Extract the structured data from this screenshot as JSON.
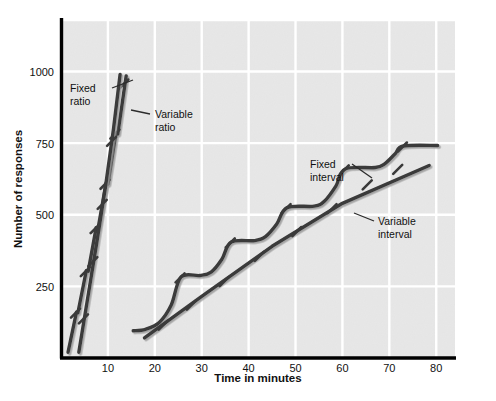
{
  "chart_data": {
    "type": "line",
    "title": "",
    "subtitle": "",
    "xlabel": "Time in minutes",
    "ylabel": "Number of responses",
    "xlim": [
      0,
      84
    ],
    "ylim": [
      0,
      1180
    ],
    "xticks": [
      10,
      20,
      30,
      40,
      50,
      60,
      70,
      80
    ],
    "xtick_labels": [
      "10",
      "20",
      "30",
      "40",
      "50",
      "60",
      "70",
      "80"
    ],
    "yticks": [
      250,
      500,
      750,
      1000
    ],
    "ytick_labels": [
      "250",
      "500",
      "750",
      "1000"
    ],
    "grid": true,
    "grid_color": "#ffffff",
    "plot_background": "#e7e7e7",
    "axis_color": "#000000",
    "line_color": "#3a3a3a",
    "legend_position": "inline-annotations",
    "series": [
      {
        "name": "Fixed ratio",
        "label": "Fixed ratio",
        "label_lines": [
          "Fixed",
          "ratio"
        ],
        "style": "stepped-steep",
        "description": "Steep stepped curve with short post-reinforcement pauses",
        "points": [
          [
            1.5,
            20
          ],
          [
            3.3,
            160
          ],
          [
            3.3,
            160
          ],
          [
            3.6,
            158
          ],
          [
            3.6,
            158
          ],
          [
            5.4,
            305
          ],
          [
            5.4,
            305
          ],
          [
            5.8,
            303
          ],
          [
            5.8,
            303
          ],
          [
            7.5,
            455
          ],
          [
            7.5,
            455
          ],
          [
            7.9,
            452
          ],
          [
            7.9,
            452
          ],
          [
            9.6,
            610
          ],
          [
            9.6,
            610
          ],
          [
            10.0,
            607
          ],
          [
            10.0,
            607
          ],
          [
            11.7,
            785
          ],
          [
            11.7,
            785
          ],
          [
            12.1,
            782
          ],
          [
            12.1,
            782
          ],
          [
            13.9,
            985
          ]
        ],
        "hash_marks": [
          [
            3.3,
            160
          ],
          [
            5.4,
            305
          ],
          [
            7.5,
            455
          ],
          [
            9.6,
            610
          ],
          [
            11.7,
            785
          ],
          [
            13.6,
            960
          ]
        ]
      },
      {
        "name": "Variable ratio",
        "label": "Variable ratio",
        "label_lines": [
          "Variable",
          "ratio"
        ],
        "style": "steady-steep",
        "description": "Steady very steep line, no pauses",
        "points": [
          [
            3.8,
            20
          ],
          [
            5.6,
            200
          ],
          [
            7.6,
            400
          ],
          [
            9.5,
            600
          ],
          [
            11.2,
            800
          ],
          [
            12.6,
            990
          ]
        ],
        "hash_marks": [
          [
            5.0,
            140
          ],
          [
            7.0,
            340
          ],
          [
            9.0,
            540
          ],
          [
            11.0,
            760
          ]
        ]
      },
      {
        "name": "Fixed interval",
        "label": "Fixed interval",
        "label_lines": [
          "Fixed",
          "interval"
        ],
        "style": "scalloped",
        "description": "Scalloped curve: accelerating runs followed by flat plateaus",
        "points": [
          [
            15.4,
            95
          ],
          [
            18.0,
            100
          ],
          [
            21.0,
            125
          ],
          [
            23.5,
            185
          ],
          [
            25.6,
            283
          ],
          [
            29.6,
            288
          ],
          [
            32.0,
            300
          ],
          [
            34.3,
            345
          ],
          [
            36.3,
            405
          ],
          [
            41.3,
            410
          ],
          [
            43.6,
            424
          ],
          [
            46.0,
            468
          ],
          [
            48.2,
            525
          ],
          [
            54.0,
            530
          ],
          [
            56.2,
            548
          ],
          [
            58.6,
            600
          ],
          [
            60.6,
            660
          ],
          [
            67.0,
            665
          ],
          [
            69.0,
            678
          ],
          [
            71.2,
            712
          ],
          [
            73.0,
            740
          ],
          [
            80.3,
            742
          ]
        ],
        "hash_marks": [
          [
            25.6,
            283
          ],
          [
            36.3,
            405
          ],
          [
            48.2,
            525
          ],
          [
            60.6,
            660
          ],
          [
            73.0,
            740
          ]
        ]
      },
      {
        "name": "Variable interval",
        "label": "Variable interval",
        "label_lines": [
          "Variable",
          "interval"
        ],
        "style": "steady-moderate",
        "description": "Steady moderate straight line, no scallops",
        "points": [
          [
            17.8,
            70
          ],
          [
            30.0,
            215
          ],
          [
            45.0,
            390
          ],
          [
            60.0,
            540
          ],
          [
            78.5,
            672
          ]
        ],
        "hash_marks": [
          [
            22.0,
            118
          ],
          [
            28.0,
            188
          ],
          [
            35.0,
            270
          ],
          [
            42.5,
            358
          ],
          [
            50.5,
            445
          ],
          [
            58.0,
            525
          ],
          [
            65.5,
            608
          ],
          [
            72.0,
            662
          ]
        ]
      }
    ],
    "annotations": [
      {
        "text": "Fixed ratio",
        "lines": [
          "Fixed",
          "ratio"
        ],
        "target_series": "Fixed ratio"
      },
      {
        "text": "Variable ratio",
        "lines": [
          "Variable",
          "ratio"
        ],
        "target_series": "Variable ratio"
      },
      {
        "text": "Fixed interval",
        "lines": [
          "Fixed",
          "interval"
        ],
        "target_series": "Fixed interval"
      },
      {
        "text": "Variable interval",
        "lines": [
          "Variable",
          "interval"
        ],
        "target_series": "Variable interval"
      }
    ]
  }
}
